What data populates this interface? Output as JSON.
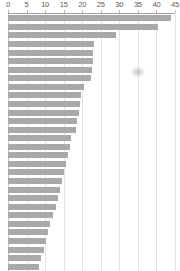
{
  "chart_data": {
    "type": "bar",
    "orientation": "horizontal",
    "title": "",
    "subtitle": "",
    "xlabel": "",
    "ylabel": "",
    "xlim": [
      0,
      45
    ],
    "ylim": null,
    "grid": true,
    "grid_axis": "x",
    "legend": false,
    "legend_position": "none",
    "axis_position": "top",
    "tick_labels": [
      "0",
      "5",
      "10",
      "15",
      "20",
      "25",
      "30",
      "35",
      "40",
      "45"
    ],
    "ticks": [
      0,
      5,
      10,
      15,
      20,
      25,
      30,
      35,
      40,
      45
    ],
    "categories": [
      "",
      "",
      "",
      "",
      "",
      "",
      "",
      "",
      "",
      "",
      "",
      "",
      "",
      "",
      "",
      "",
      "",
      "",
      "",
      "",
      "",
      "",
      "",
      "",
      "",
      "",
      "",
      "",
      "",
      ""
    ],
    "values": [
      43.8,
      40.4,
      29.0,
      23.2,
      23.0,
      22.8,
      22.6,
      22.4,
      20.4,
      19.8,
      19.4,
      19.0,
      18.6,
      18.2,
      17.0,
      16.6,
      16.2,
      15.6,
      15.0,
      14.6,
      14.0,
      13.4,
      12.8,
      12.2,
      11.4,
      10.8,
      10.2,
      9.6,
      9.0,
      8.4
    ],
    "bar_color": "#a9a9a9",
    "grid_color": "#e3e3e3",
    "axis_color": "#9e9e9e",
    "tick_text_color": "#5a5a5a",
    "background_color": "#ffffff",
    "annotations": [
      {
        "name": "smudge-artifact",
        "kind": "smudge",
        "x": 34.7,
        "row": 7,
        "note": "faint gray smudge over plot area"
      }
    ]
  }
}
